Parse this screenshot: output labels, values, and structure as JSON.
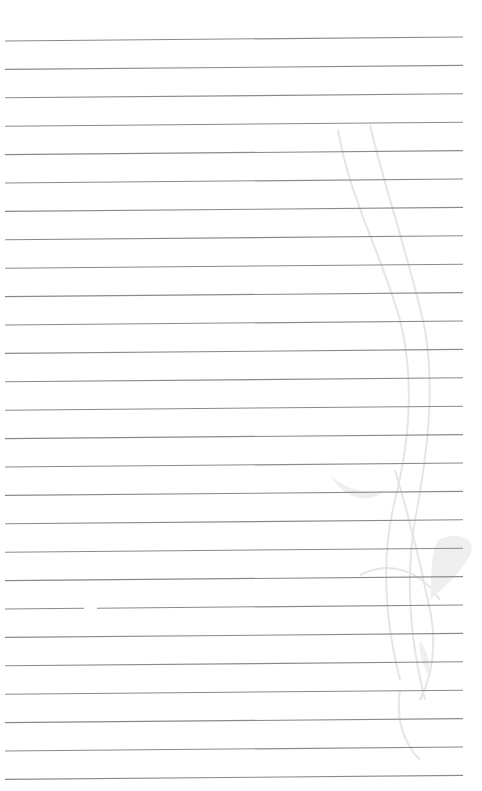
{
  "page": {
    "type": "lined-paper",
    "background_color": "#ffffff",
    "line_color": "#8a8a8a",
    "line_count": 27,
    "line_spacing_px": 28.4,
    "first_line_left_y": 41,
    "first_line_right_y": 37,
    "line_x_start": 5,
    "line_x_end": 463,
    "gap": {
      "line_index": 20,
      "x_start": 84,
      "x_end": 97
    }
  },
  "decoration": {
    "name": "faint-swirl-ornament",
    "color": "#e6e6e6",
    "fill_color": "#efefef"
  }
}
